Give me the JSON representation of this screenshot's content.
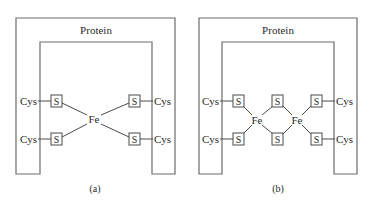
{
  "diagram": {
    "panels": [
      {
        "id": "a",
        "caption": "(a)",
        "protein_label": "Protein",
        "cys_labels": [
          "Cys",
          "Cys",
          "Cys",
          "Cys"
        ],
        "sulfur_label": "S",
        "iron_labels": [
          "Fe"
        ]
      },
      {
        "id": "b",
        "caption": "(b)",
        "protein_label": "Protein",
        "cys_labels": [
          "Cys",
          "Cys",
          "Cys",
          "Cys"
        ],
        "sulfur_label": "S",
        "iron_labels": [
          "Fe",
          "Fe"
        ]
      }
    ],
    "colors": {
      "frame": "#6b6b6b",
      "bond": "#4a4a4a",
      "text": "#2a2a2a"
    }
  }
}
